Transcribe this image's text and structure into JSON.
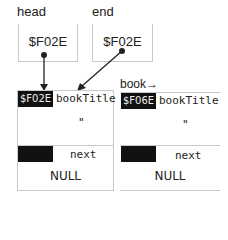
{
  "pointers": [
    {
      "label": "head",
      "value": "$F02E"
    },
    {
      "label": "end",
      "value": "$F02E"
    }
  ],
  "nodes": [
    {
      "address": "$F02E",
      "title_field": "bookTitle",
      "title_value": "\"",
      "next_field": "next",
      "next_value": "NULL",
      "prefix_label": ""
    },
    {
      "address": "$F06E",
      "title_field": "bookTitle",
      "title_value": "\"",
      "next_field": "next",
      "next_value": "NULL",
      "prefix_label": "book→"
    }
  ],
  "colors": {
    "border": "#c8c8c8",
    "cell_fill": "#111111",
    "arrow": "#222222"
  }
}
